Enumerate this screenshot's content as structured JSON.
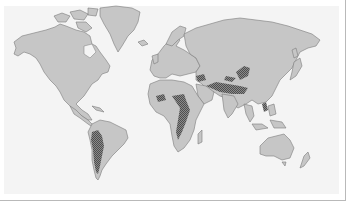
{
  "map": {
    "type": "world-map",
    "style": "grayscale",
    "colors": {
      "background": "#ffffff",
      "panel": "#f4f4f4",
      "land": "#c6c6c6",
      "coastline": "#7a7a7a",
      "highlighted_region": "#6e6e6e",
      "frame_border": "#b9b9b9"
    },
    "regions": [
      {
        "name": "North America"
      },
      {
        "name": "Greenland"
      },
      {
        "name": "South America",
        "highlighted": "Andes / western coast"
      },
      {
        "name": "Europe"
      },
      {
        "name": "Africa",
        "highlighted": "Sahara band, East Africa, Southern Africa"
      },
      {
        "name": "Asia",
        "highlighted": "Central Asia, Himalaya / Tibet, Middle East, Philippines"
      },
      {
        "name": "Australia"
      },
      {
        "name": "New Zealand"
      }
    ],
    "legend": null
  }
}
